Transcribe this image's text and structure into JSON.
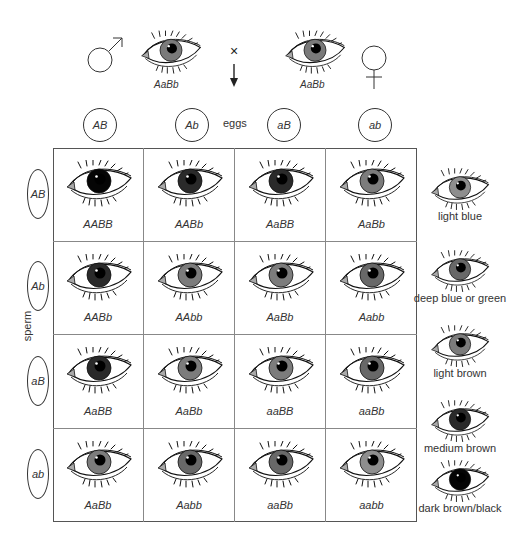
{
  "parents": {
    "male": {
      "symbol": "male-symbol",
      "genotype": "AaBb",
      "iris_color": "#7a7a7a"
    },
    "cross_symbol": "×",
    "female": {
      "symbol": "female-symbol",
      "genotype": "AaBb",
      "iris_color": "#7a7a7a"
    }
  },
  "eggs": {
    "label": "eggs",
    "gametes": [
      "AB",
      "Ab",
      "aB",
      "ab"
    ]
  },
  "sperm": {
    "label": "sperm",
    "gametes": [
      "AB",
      "Ab",
      "aB",
      "ab"
    ]
  },
  "punnett": {
    "rows": [
      [
        {
          "genotype": "AABB",
          "iris_color": "#050505"
        },
        {
          "genotype": "AABb",
          "iris_color": "#2a2a2a"
        },
        {
          "genotype": "AaBB",
          "iris_color": "#2a2a2a"
        },
        {
          "genotype": "AaBb",
          "iris_color": "#7c7c7c"
        }
      ],
      [
        {
          "genotype": "AABb",
          "iris_color": "#2a2a2a"
        },
        {
          "genotype": "AAbb",
          "iris_color": "#7c7c7c"
        },
        {
          "genotype": "AaBb",
          "iris_color": "#7c7c7c"
        },
        {
          "genotype": "Aabb",
          "iris_color": "#686868"
        }
      ],
      [
        {
          "genotype": "AaBB",
          "iris_color": "#2a2a2a"
        },
        {
          "genotype": "AaBb",
          "iris_color": "#7c7c7c"
        },
        {
          "genotype": "aaBB",
          "iris_color": "#7c7c7c"
        },
        {
          "genotype": "aaBb",
          "iris_color": "#686868"
        }
      ],
      [
        {
          "genotype": "AaBb",
          "iris_color": "#7c7c7c"
        },
        {
          "genotype": "Aabb",
          "iris_color": "#686868"
        },
        {
          "genotype": "aaBb",
          "iris_color": "#686868"
        },
        {
          "genotype": "aabb",
          "iris_color": "#8e8e8e"
        }
      ]
    ]
  },
  "legend": [
    {
      "label": "light blue",
      "iris_color": "#8e8e8e"
    },
    {
      "label": "deep blue or green",
      "iris_color": "#686868"
    },
    {
      "label": "light brown",
      "iris_color": "#7c7c7c"
    },
    {
      "label": "medium brown",
      "iris_color": "#2a2a2a"
    },
    {
      "label": "dark brown/black",
      "iris_color": "#050505"
    }
  ]
}
